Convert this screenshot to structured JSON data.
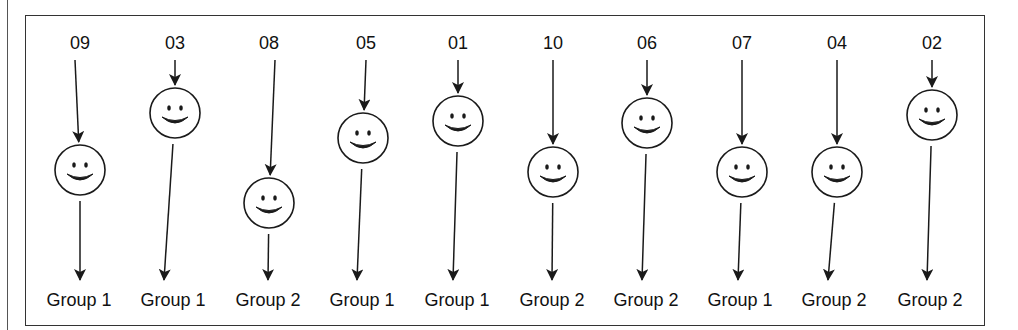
{
  "diagram": {
    "colors": {
      "stroke": "#1a1a1a",
      "text": "#111111",
      "background": "#ffffff",
      "frame": "#333333"
    },
    "smiley_radius": 25,
    "participants": [
      {
        "id": "09",
        "label": "09",
        "label_x": 80,
        "start_x": 75,
        "face": [
          80,
          170
        ],
        "tip_x": 80,
        "group": "Group 1",
        "group_x": 79
      },
      {
        "id": "03",
        "label": "03",
        "label_x": 175,
        "start_x": 175,
        "face": [
          175,
          113
        ],
        "tip_x": 164,
        "group": "Group 1",
        "group_x": 173
      },
      {
        "id": "08",
        "label": "08",
        "label_x": 269,
        "start_x": 275,
        "face": [
          269,
          203
        ],
        "tip_x": 268,
        "group": "Group 2",
        "group_x": 268
      },
      {
        "id": "05",
        "label": "05",
        "label_x": 366,
        "start_x": 366,
        "face": [
          363,
          138
        ],
        "tip_x": 357,
        "group": "Group 1",
        "group_x": 362
      },
      {
        "id": "01",
        "label": "01",
        "label_x": 458,
        "start_x": 458,
        "face": [
          458,
          121
        ],
        "tip_x": 453,
        "group": "Group 1",
        "group_x": 457
      },
      {
        "id": "10",
        "label": "10",
        "label_x": 553,
        "start_x": 553,
        "face": [
          553,
          172
        ],
        "tip_x": 552,
        "group": "Group 2",
        "group_x": 552
      },
      {
        "id": "06",
        "label": "06",
        "label_x": 647,
        "start_x": 647,
        "face": [
          647,
          123
        ],
        "tip_x": 642,
        "group": "Group 2",
        "group_x": 646
      },
      {
        "id": "07",
        "label": "07",
        "label_x": 742,
        "start_x": 742,
        "face": [
          742,
          172
        ],
        "tip_x": 738,
        "group": "Group 1",
        "group_x": 740
      },
      {
        "id": "04",
        "label": "04",
        "label_x": 837,
        "start_x": 837,
        "face": [
          837,
          172
        ],
        "tip_x": 828,
        "group": "Group 2",
        "group_x": 834
      },
      {
        "id": "02",
        "label": "02",
        "label_x": 932,
        "start_x": 932,
        "face": [
          932,
          115
        ],
        "tip_x": 927,
        "group": "Group 2",
        "group_x": 930
      }
    ],
    "layout": {
      "label_y": 49,
      "arrow_start_y": 60,
      "arrow_end_y": 280,
      "group_label_y": 306
    }
  }
}
